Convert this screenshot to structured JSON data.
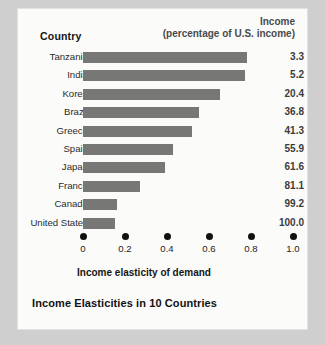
{
  "header": {
    "country_label": "Country",
    "income_line1": "Income",
    "income_line2": "(percentage of U.S. income)"
  },
  "caption": "Income Elasticities in 10 Countries",
  "chart_data": {
    "type": "bar",
    "orientation": "horizontal",
    "title": "Income Elasticities in 10 Countries",
    "xlabel": "Income elasticity of demand",
    "ylabel": "Country",
    "xlim": [
      0,
      1.0
    ],
    "xticks": [
      "0",
      "0.2",
      "0.4",
      "0.6",
      "0.8",
      "1.0"
    ],
    "xtick_values": [
      0,
      0.2,
      0.4,
      0.6,
      0.8,
      1.0
    ],
    "grid": false,
    "legend": "none",
    "tick_style": "dot-markers",
    "bar_color": "#777776",
    "categories": [
      "Tanzania",
      "India",
      "Korea",
      "Brazil",
      "Greece",
      "Spain",
      "Japan",
      "France",
      "Canada",
      "United States"
    ],
    "values": [
      0.78,
      0.77,
      0.65,
      0.55,
      0.52,
      0.43,
      0.39,
      0.27,
      0.16,
      0.15
    ],
    "series": [
      {
        "name": "Income elasticity of demand",
        "values": [
          0.78,
          0.77,
          0.65,
          0.55,
          0.52,
          0.43,
          0.39,
          0.27,
          0.16,
          0.15
        ]
      }
    ],
    "annotations": {
      "column_header": "Income (percentage of U.S. income)",
      "income_percent_of_us": [
        3.3,
        5.2,
        20.4,
        36.8,
        41.3,
        55.9,
        61.6,
        81.1,
        99.2,
        100.0
      ],
      "income_percent_labels": [
        "3.3",
        "5.2",
        "20.4",
        "36.8",
        "41.3",
        "55.9",
        "61.6",
        "81.1",
        "99.2",
        "100.0"
      ]
    }
  }
}
